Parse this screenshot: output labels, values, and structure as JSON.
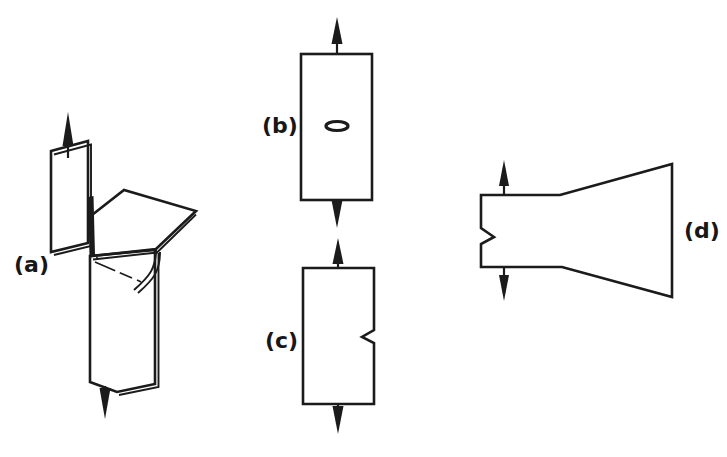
{
  "figure": {
    "background_color": "#ffffff",
    "line_color": "#1b1b1b",
    "width": 727,
    "height": 457,
    "panels": [
      {
        "id": "a",
        "label": "(a)",
        "label_x": 14,
        "label_y": 272,
        "description": "trouser-tear folded sheet specimen",
        "arrows": [
          "up",
          "down"
        ]
      },
      {
        "id": "b",
        "label": "(b)",
        "label_x": 262,
        "label_y": 133,
        "description": "rectangular plate with central elliptical crack",
        "arrows": [
          "up",
          "down"
        ],
        "defect": "central-ellipse"
      },
      {
        "id": "c",
        "label": "(c)",
        "label_x": 265,
        "label_y": 348,
        "description": "rectangular plate with single edge notch",
        "arrows": [
          "up",
          "down"
        ],
        "defect": "edge-notch-right"
      },
      {
        "id": "d",
        "label": "(d)",
        "label_x": 684,
        "label_y": 238,
        "description": "tapered double cantilever beam specimen with edge notch",
        "arrows": [
          "up",
          "down"
        ],
        "defect": "edge-notch-left"
      }
    ],
    "icons": {
      "arrow_up": "arrow-up-icon",
      "arrow_down": "arrow-down-icon",
      "ellipse_crack": "ellipse-crack-icon",
      "notch": "notch-icon"
    }
  }
}
